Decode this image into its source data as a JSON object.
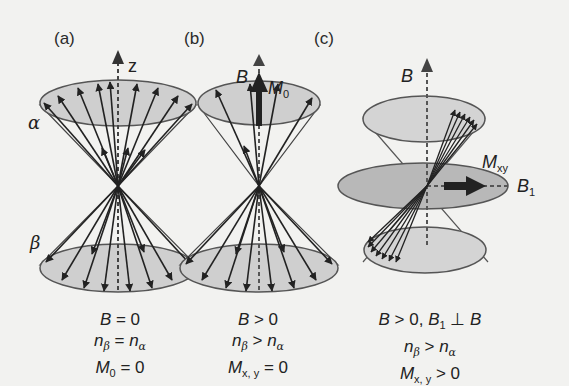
{
  "figure": {
    "colors": {
      "background": "#f2f2f0",
      "cone_fill": "#cfcfcf",
      "disk_fill": "#b8b8b8",
      "stroke": "#222222"
    },
    "panels": [
      {
        "id": "a",
        "label": "(a)",
        "axis_label": "z",
        "state_labels": {
          "upper": "α",
          "lower": "β"
        },
        "caption": {
          "line1": {
            "var": "B",
            "rel": " = 0"
          },
          "line2": {
            "left": "n",
            "left_sub": "β",
            "rel": " = ",
            "right": "n",
            "right_sub": "α"
          },
          "line3": {
            "var": "M",
            "var_sub": "0",
            "rel": " = 0"
          }
        }
      },
      {
        "id": "b",
        "label": "(b)",
        "axis_label": "B",
        "vector_label": {
          "var": "M",
          "sub": "0"
        },
        "caption": {
          "line1": {
            "var": "B",
            "rel": " > 0"
          },
          "line2": {
            "left": "n",
            "left_sub": "β",
            "rel": " > ",
            "right": "n",
            "right_sub": "α"
          },
          "line3": {
            "var": "M",
            "var_sub": "x, y",
            "rel": " = 0"
          }
        }
      },
      {
        "id": "c",
        "label": "(c)",
        "axis_label": "B",
        "vector_label": {
          "var": "M",
          "sub": "xy"
        },
        "field_label": {
          "var": "B",
          "sub": "1"
        },
        "caption": {
          "line1": {
            "var": "B",
            "rel": " > 0, ",
            "var2": "B",
            "var2_sub": "1",
            "rel2": " ⊥ ",
            "var3": "B"
          },
          "line2": {
            "left": "n",
            "left_sub": "β",
            "rel": " > ",
            "right": "n",
            "right_sub": "α"
          },
          "line3": {
            "var": "M",
            "var_sub": "x, y",
            "rel": " > 0"
          }
        }
      }
    ]
  }
}
